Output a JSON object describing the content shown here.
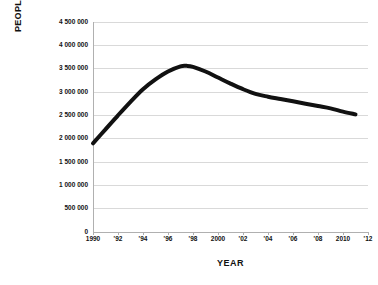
{
  "chart_data": {
    "type": "line",
    "title": "",
    "xlabel": "YEAR",
    "ylabel": "PEOPLE",
    "xlim": [
      1990,
      2012
    ],
    "ylim": [
      0,
      4500000
    ],
    "grid": "horizontal",
    "legend": "none",
    "line_color": "#111111",
    "gridline_color": "#d9d9d9",
    "axis_color": "#b0b0b0",
    "x_tick_labels": [
      "1990",
      "'92",
      "'94",
      "'96",
      "'98",
      "2000",
      "'02",
      "'04",
      "'06",
      "'08",
      "2010",
      "'12"
    ],
    "x_tick_values": [
      1990,
      1992,
      1994,
      1996,
      1998,
      2000,
      2002,
      2004,
      2006,
      2008,
      2010,
      2012
    ],
    "y_tick_labels": [
      "4 500 000",
      "4 000 000",
      "3 500 000",
      "3 000 000",
      "2 500 000",
      "2 000 000",
      "1 500 000",
      "1 000 000",
      "500 000",
      "0"
    ],
    "y_tick_values": [
      4500000,
      4000000,
      3500000,
      3000000,
      2500000,
      2000000,
      1500000,
      1000000,
      500000,
      0
    ],
    "x": [
      1990,
      1991,
      1992,
      1993,
      1994,
      1995,
      1996,
      1997,
      1997.5,
      1998,
      1999,
      2000,
      2001,
      2002,
      2003,
      2004,
      2005,
      2006,
      2007,
      2008,
      2009,
      2010,
      2011
    ],
    "values": [
      1900000,
      2200000,
      2500000,
      2790000,
      3060000,
      3270000,
      3440000,
      3550000,
      3560000,
      3540000,
      3440000,
      3310000,
      3180000,
      3060000,
      2960000,
      2900000,
      2850000,
      2800000,
      2750000,
      2700000,
      2650000,
      2580000,
      2520000
    ],
    "series": [
      {
        "name": "People",
        "values": [
          1900000,
          2200000,
          2500000,
          2790000,
          3060000,
          3270000,
          3440000,
          3550000,
          3560000,
          3540000,
          3440000,
          3310000,
          3180000,
          3060000,
          2960000,
          2900000,
          2850000,
          2800000,
          2750000,
          2700000,
          2650000,
          2580000,
          2520000
        ]
      }
    ],
    "annotations": {
      "peak_year": 1997.5,
      "peak_value": 3560000,
      "start_year": 1990,
      "start_value": 1900000,
      "end_year": 2011,
      "end_value": 2520000
    }
  }
}
